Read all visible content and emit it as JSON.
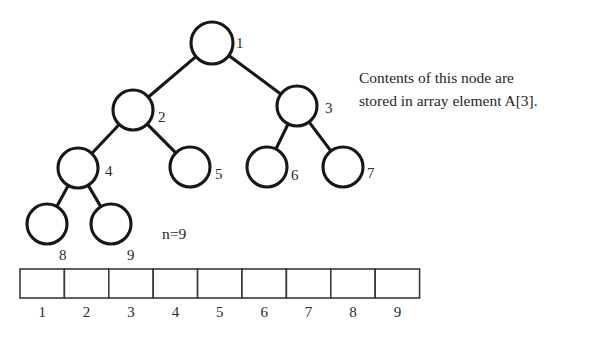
{
  "figure": {
    "background_color": "#ffffff",
    "ink_color": "#171717"
  },
  "annotation": {
    "line1": "Contents of this node are",
    "line2": "stored in array element A[3]."
  },
  "count": {
    "label": "n=9"
  },
  "tree": {
    "nodes": [
      {
        "id": 1,
        "label": "1",
        "cx": 212,
        "cy": 43,
        "r": 21,
        "label_x": 236,
        "label_y": 48
      },
      {
        "id": 2,
        "label": "2",
        "cx": 133,
        "cy": 110,
        "r": 20,
        "label_x": 158,
        "label_y": 122
      },
      {
        "id": 3,
        "label": "3",
        "cx": 297,
        "cy": 106,
        "r": 20,
        "label_x": 325,
        "label_y": 113
      },
      {
        "id": 4,
        "label": "4",
        "cx": 78,
        "cy": 168,
        "r": 20,
        "label_x": 105,
        "label_y": 176
      },
      {
        "id": 5,
        "label": "5",
        "cx": 190,
        "cy": 167,
        "r": 20,
        "label_x": 215,
        "label_y": 179
      },
      {
        "id": 6,
        "label": "6",
        "cx": 267,
        "cy": 167,
        "r": 20,
        "label_x": 291,
        "label_y": 180
      },
      {
        "id": 7,
        "label": "7",
        "cx": 343,
        "cy": 167,
        "r": 20,
        "label_x": 367,
        "label_y": 178
      },
      {
        "id": 8,
        "label": "8",
        "cx": 47,
        "cy": 224,
        "r": 20,
        "label_x": 59,
        "label_y": 260
      },
      {
        "id": 9,
        "label": "9",
        "cx": 111,
        "cy": 224,
        "r": 20,
        "label_x": 127,
        "label_y": 260
      }
    ],
    "edges": [
      {
        "from": 1,
        "to": 2
      },
      {
        "from": 1,
        "to": 3
      },
      {
        "from": 2,
        "to": 4
      },
      {
        "from": 2,
        "to": 5
      },
      {
        "from": 3,
        "to": 6
      },
      {
        "from": 3,
        "to": 7
      },
      {
        "from": 4,
        "to": 8
      },
      {
        "from": 4,
        "to": 9
      }
    ]
  },
  "array": {
    "x": 20,
    "y": 269,
    "cell_width": 44.4,
    "cell_height": 29,
    "label_y": 317,
    "cells": [
      {
        "index": "1",
        "value": ""
      },
      {
        "index": "2",
        "value": ""
      },
      {
        "index": "3",
        "value": ""
      },
      {
        "index": "4",
        "value": ""
      },
      {
        "index": "5",
        "value": ""
      },
      {
        "index": "6",
        "value": ""
      },
      {
        "index": "7",
        "value": ""
      },
      {
        "index": "8",
        "value": ""
      },
      {
        "index": "9",
        "value": ""
      }
    ]
  }
}
